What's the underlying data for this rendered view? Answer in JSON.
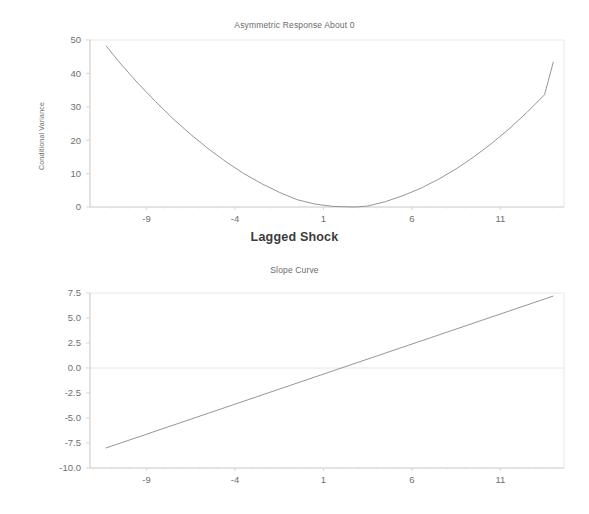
{
  "figure": {
    "background": "#ffffff",
    "line_color": "#8a8a8a",
    "axis_color": "#b9b9b9",
    "text_color": "#6b6b6b"
  },
  "chart_data": [
    {
      "type": "line",
      "name": "asymmetric-response",
      "title": "Asymmetric Response About 0",
      "xlabel": "Lagged Shock",
      "ylabel": "Conditional Variance",
      "xlim": [
        -12.2,
        14.6
      ],
      "ylim": [
        0,
        50
      ],
      "xticks": [
        -9,
        -4,
        1,
        6,
        11
      ],
      "xtick_labels": [
        "-9",
        "-4",
        "1",
        "6",
        "11"
      ],
      "yticks": [
        0,
        10,
        20,
        30,
        40,
        50
      ],
      "ytick_labels": [
        "0",
        "10",
        "20",
        "30",
        "40",
        "50"
      ],
      "grid": false,
      "legend": "none",
      "x": [
        -11.3,
        -10.5,
        -9.5,
        -8.5,
        -7.5,
        -6.5,
        -5.5,
        -4.5,
        -3.5,
        -2.5,
        -1.5,
        -0.5,
        0.5,
        1.5,
        2.5,
        2.8,
        3.5,
        4.5,
        5.5,
        6.5,
        7.5,
        8.5,
        9.5,
        10.5,
        11.5,
        12.5,
        13.5,
        14.0
      ],
      "y": [
        48.3,
        43.1,
        37.1,
        31.6,
        26.4,
        21.7,
        17.4,
        13.5,
        10.0,
        7.0,
        4.4,
        2.2,
        0.9,
        0.2,
        0.02,
        0.0,
        0.3,
        1.6,
        3.4,
        5.6,
        8.3,
        11.4,
        15.0,
        19.0,
        23.4,
        28.3,
        33.6,
        43.5
      ]
    },
    {
      "type": "line",
      "name": "slope-curve",
      "title": "Slope Curve",
      "xlabel": "",
      "ylabel": "",
      "xlim": [
        -12.2,
        14.6
      ],
      "ylim": [
        -10.0,
        7.5
      ],
      "xticks": [
        -9,
        -4,
        1,
        6,
        11
      ],
      "xtick_labels": [
        "-9",
        "-4",
        "1",
        "6",
        "11"
      ],
      "yticks": [
        -10.0,
        -7.5,
        -5.0,
        -2.5,
        0.0,
        2.5,
        5.0,
        7.5
      ],
      "ytick_labels": [
        "-10.0",
        "-7.5",
        "-5.0",
        "-2.5",
        "0.0",
        "2.5",
        "5.0",
        "7.5"
      ],
      "grid": false,
      "legend": "none",
      "zero_crossing_x": 3.2,
      "x": [
        -11.3,
        14.0
      ],
      "y": [
        -8.0,
        7.2
      ]
    }
  ],
  "top_chart": {
    "title": "Asymmetric Response About 0",
    "xlabel": "Lagged Shock",
    "ylabel": "Conditional Variance",
    "xticks": [
      "-9",
      "-4",
      "1",
      "6",
      "11"
    ],
    "yticks": [
      "50",
      "40",
      "30",
      "20",
      "10",
      "0"
    ]
  },
  "bottom_chart": {
    "title": "Slope Curve",
    "xticks": [
      "-9",
      "-4",
      "1",
      "6",
      "11"
    ],
    "yticks": [
      "7.5",
      "5.0",
      "2.5",
      "0.0",
      "-2.5",
      "-5.0",
      "-7.5",
      "-10.0"
    ]
  }
}
